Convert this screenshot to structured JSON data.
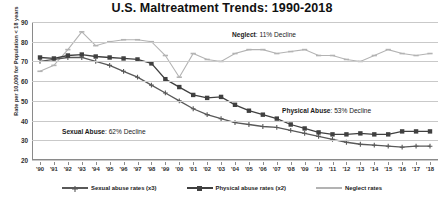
{
  "chart_data": {
    "type": "line",
    "title": "U.S. Maltreatment Trends:  1990-2018",
    "xlabel": "",
    "ylabel": "Rate per 10,000 for Population  < 18 years",
    "ylim": [
      20,
      90
    ],
    "yticks": [
      20,
      30,
      40,
      50,
      60,
      70,
      80,
      90
    ],
    "grid": true,
    "legend_position": "bottom",
    "categories": [
      "'90",
      "'91",
      "'92",
      "'93",
      "'94",
      "'95",
      "'96",
      "'97",
      "'98",
      "'99",
      "'00",
      "'01",
      "'02",
      "'03",
      "'04",
      "'05",
      "'06",
      "'07",
      "'08",
      "'09",
      "'10",
      "'11",
      "'12",
      "'13",
      "'14",
      "'15",
      "'16",
      "'17",
      "'18"
    ],
    "series": [
      {
        "name": "Sexual abuse rates (x3)",
        "color": "#595959",
        "marker": "plus",
        "values": [
          70,
          71,
          72,
          72,
          70,
          68,
          65,
          62,
          58,
          54,
          50,
          46,
          43,
          41,
          39,
          38,
          37,
          36.5,
          35,
          33.5,
          32,
          30.5,
          29,
          28,
          27.5,
          27,
          26.5,
          27,
          27
        ]
      },
      {
        "name": "Physical abuse rates (x2)",
        "color": "#404040",
        "marker": "square",
        "values": [
          72,
          71.5,
          73,
          73.5,
          72.5,
          72,
          71.5,
          71,
          69,
          61,
          57,
          53,
          51.5,
          52,
          48,
          45,
          43,
          41,
          38,
          36,
          34,
          33,
          33,
          33.5,
          33,
          33,
          34.5,
          34.5,
          34.5
        ]
      },
      {
        "name": "Neglect rates",
        "color": "#b3b3b3",
        "marker": "dash",
        "values": [
          65,
          68,
          76,
          85,
          78,
          80,
          81,
          81,
          80,
          73,
          62,
          74,
          71,
          70,
          74,
          76,
          76,
          74,
          75,
          76,
          73,
          73,
          71,
          70,
          73,
          76,
          74,
          73,
          74
        ]
      }
    ],
    "annotations": [
      {
        "id": "neglect-annotation",
        "bold": "Neglect",
        "rest": ": 11% Decline",
        "x": 232,
        "y": 31
      },
      {
        "id": "physical-abuse-annotation",
        "bold": "Physical Abuse",
        "rest": ": 53% Decline",
        "x": 282,
        "y": 107
      },
      {
        "id": "sexual-abuse-annotation",
        "bold": "Sexual Abuse",
        "rest": ":  62% Decline",
        "x": 62,
        "y": 128
      }
    ]
  }
}
